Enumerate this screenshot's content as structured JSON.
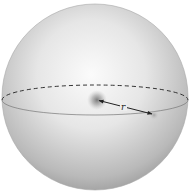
{
  "diagram": {
    "type": "sphere",
    "label_r": "r",
    "colors": {
      "background": "#ffffff",
      "sphere_light": "#f8f8f8",
      "sphere_dark": "#9a9a9a",
      "line": "#333333",
      "center_glow": "#777777"
    },
    "sphere": {
      "cx": 95,
      "cy": 97,
      "r": 93
    },
    "equator": {
      "cx": 95,
      "cy": 100,
      "rx": 93,
      "ry": 15
    },
    "center_point": {
      "x": 97,
      "y": 100
    },
    "surface_point": {
      "x": 154,
      "y": 115
    },
    "vector": {
      "from": "center_point",
      "to": "surface_point",
      "double_headed": true
    }
  }
}
